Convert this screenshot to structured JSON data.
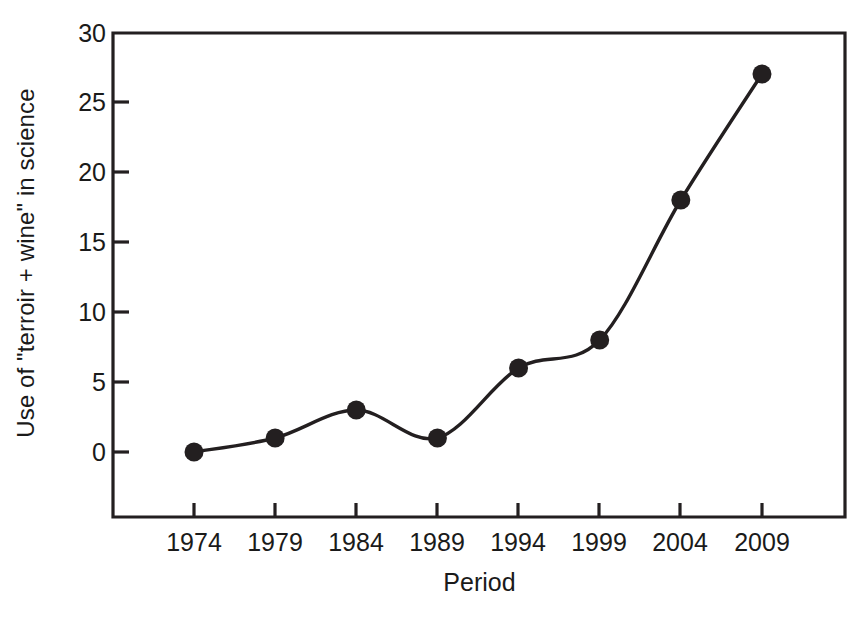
{
  "chart_data": {
    "type": "line",
    "title": "",
    "xlabel": "Period",
    "ylabel": "Use of \"terroir + wine\" in science",
    "categories": [
      "1974",
      "1979",
      "1984",
      "1989",
      "1994",
      "1999",
      "2004",
      "2009"
    ],
    "x": [
      1974,
      1979,
      1984,
      1989,
      1994,
      1999,
      2004,
      2009
    ],
    "values": [
      0,
      1,
      3,
      1,
      6,
      8,
      18,
      27
    ],
    "series": [
      {
        "name": "Use of \"terroir + wine\" in science",
        "values": [
          0,
          1,
          3,
          1,
          6,
          8,
          18,
          27
        ]
      }
    ],
    "yticks": [
      0,
      5,
      10,
      15,
      20,
      25,
      30
    ],
    "ytick_labels": [
      "0",
      "5",
      "10",
      "15",
      "20",
      "25",
      "30"
    ],
    "xtick_labels": [
      "1974",
      "1979",
      "1984",
      "1989",
      "1994",
      "1999",
      "2004",
      "2009"
    ],
    "ylim": [
      -2.2,
      30
    ],
    "grid": false,
    "legend": false,
    "legend_position": "none",
    "marker": "filled-circle",
    "line_color": "#231f20",
    "marker_color": "#231f20",
    "axis_color": "#231f20",
    "background_color": "#ffffff",
    "smoothing": "spline"
  },
  "axes": {
    "x_title": "Period",
    "y_title": "Use of \"terroir + wine\" in science"
  }
}
